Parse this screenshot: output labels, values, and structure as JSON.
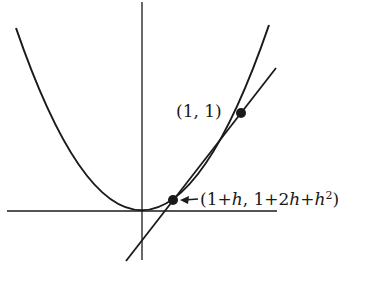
{
  "diagram": {
    "colors": {
      "stroke": "#1a1a1a",
      "background": "#ffffff"
    },
    "curve": {
      "name": "parabola",
      "equation": "y = x^2"
    },
    "points": [
      {
        "id": "p1",
        "label": "(1, 1)"
      },
      {
        "id": "p2",
        "label_parts": [
          "(1+",
          "h",
          ", 1+2",
          "h",
          "+",
          "h",
          "2",
          ")"
        ],
        "label": "(1+h, 1+2h+h^2)"
      }
    ],
    "line": {
      "name": "secant-line"
    },
    "axes": {
      "x": "horizontal axis",
      "y": "vertical axis"
    }
  }
}
